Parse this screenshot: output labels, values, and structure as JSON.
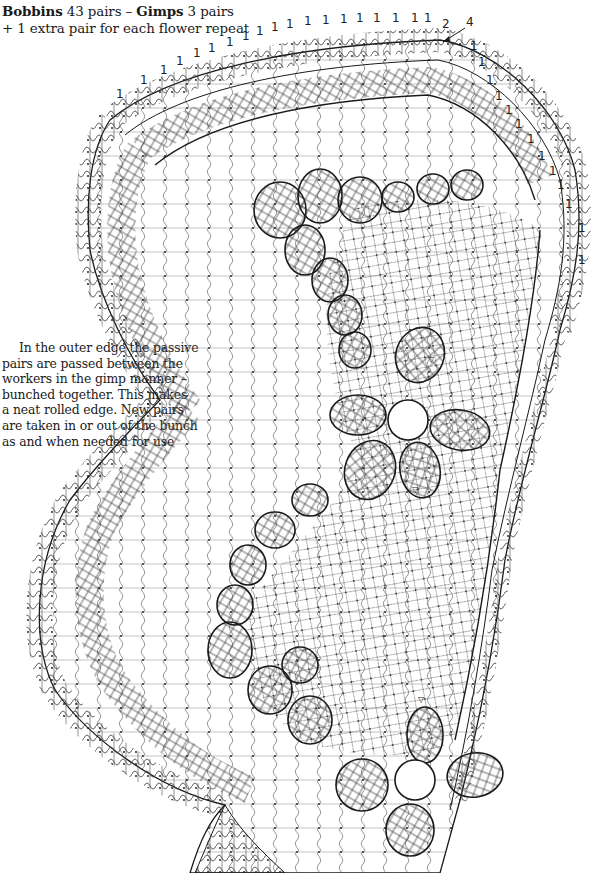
{
  "header": {
    "bobbins_label": "Bobbins",
    "bobbins_value": " 43 pairs – ",
    "gimps_label": "Gimps",
    "gimps_value": " 3 pairs",
    "line2": "+ 1 extra pair for each flower repeat"
  },
  "note": {
    "lines": [
      "In the outer edge the passive",
      "pairs are passed between the",
      "workers in the gimp manner –",
      "bunched together. This makes",
      "a neat rolled edge. New pairs",
      "are taken in or out of the bunch",
      "as and when needed for use"
    ]
  },
  "diagram": {
    "type": "bobbin-lace-pricking",
    "pair_ticks_top": [
      "1",
      "1",
      "1",
      "1",
      "1",
      "1",
      "1",
      "1",
      "1",
      "1",
      "1",
      "1",
      "1",
      "1",
      "1",
      "1",
      "1",
      "1",
      "1",
      "2"
    ],
    "pair_ticks_right": [
      "1",
      "1",
      "1",
      "1",
      "1",
      "1",
      "1",
      "1",
      "1",
      "1",
      "1",
      "1",
      "1"
    ],
    "arrow_label": "4",
    "corner_labels": [
      "2",
      "3"
    ],
    "flower_markers": [
      "▽",
      "▽",
      "▽"
    ],
    "colors": {
      "ink": "#1a1a1a",
      "thread": "#555555",
      "background": "#ffffff"
    }
  }
}
